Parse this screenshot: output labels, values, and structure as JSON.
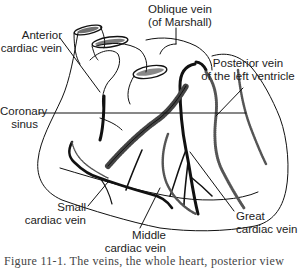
{
  "figure": {
    "type": "anatomical line drawing",
    "labels": {
      "oblique_vein_1": "Oblique vein",
      "oblique_vein_2": "(of Marshall)",
      "anterior_cardiac_vein_1": "Anterior",
      "anterior_cardiac_vein_2": "cardiac vein",
      "posterior_vein_1": "Posterior vein",
      "posterior_vein_2": "of the left ventricle",
      "coronary_sinus_1": "Coronary",
      "coronary_sinus_2": "sinus",
      "small_cardiac_vein_1": "Small",
      "small_cardiac_vein_2": "cardiac vein",
      "middle_cardiac_vein_1": "Middle",
      "middle_cardiac_vein_2": "cardiac vein",
      "great_cardiac_vein_1": "Great",
      "great_cardiac_vein_2": "cardiac vein"
    },
    "caption": "Figure 11-1. The veins, the whole heart, posterior view"
  },
  "colors": {
    "ink": "#111111",
    "background": "#ffffff"
  }
}
